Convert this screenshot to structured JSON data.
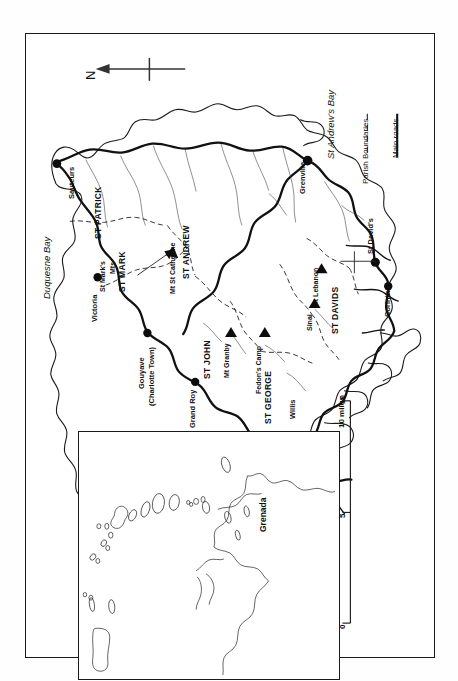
{
  "map": {
    "title": "Grenada parishes map",
    "orientation_note": "printed sideways",
    "north_arrow": {
      "label": "N",
      "icon": "north-arrow-icon"
    },
    "legend": {
      "items": [
        {
          "label": "Parish Boundaries",
          "style": "dashed"
        },
        {
          "label": "Main roads",
          "style": "solid"
        }
      ]
    },
    "scale_bar": {
      "unit_label": "10 miles",
      "ticks": [
        "0",
        "5",
        "10"
      ]
    },
    "parishes": [
      {
        "label": "ST PATRICK"
      },
      {
        "label": "ST MARK"
      },
      {
        "label": "ST ANDREW"
      },
      {
        "label": "ST JOHN"
      },
      {
        "label": "ST GEORGE"
      },
      {
        "label": "ST DAVIDS"
      }
    ],
    "towns": [
      {
        "label": "Sauteurs"
      },
      {
        "label": "Victoria"
      },
      {
        "label": "Gouyave"
      },
      {
        "label": "(Charlotte Town)"
      },
      {
        "label": "Grand Roy"
      },
      {
        "label": "St George's"
      },
      {
        "label": "Grenville"
      },
      {
        "label": "St David's"
      },
      {
        "label": "Corinth"
      },
      {
        "label": "Willis"
      }
    ],
    "peaks": [
      {
        "label": "Mt St Catherine"
      },
      {
        "label": "Mt Granby"
      },
      {
        "label": "Fedon's Camp"
      },
      {
        "label": "Mt Lebanon"
      },
      {
        "label": "Sinai"
      },
      {
        "label": "St Mark's"
      },
      {
        "label": "Mts"
      }
    ],
    "bays": [
      {
        "label": "Duquesne Bay"
      },
      {
        "label": "St Andrew's Bay"
      },
      {
        "label": "Grande Anse Bay"
      }
    ],
    "inset": {
      "label": "Grenada"
    }
  },
  "colors": {
    "ink": "#1a1a1a",
    "paper": "#ffffff",
    "rule": "#222222"
  }
}
